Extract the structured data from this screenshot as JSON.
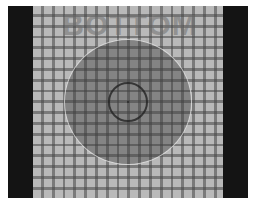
{
  "target": {
    "label": "BOTTOM",
    "colors": {
      "border_bars": "#141414",
      "background": "#b9b9b9",
      "grid_lines": "#464646",
      "disc": "#6e6e6e",
      "ring": "#232323"
    },
    "grid": {
      "columns": 18,
      "rows": 18
    }
  }
}
